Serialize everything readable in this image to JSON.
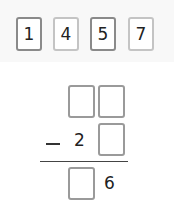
{
  "digit_cards": [
    {
      "value": "1",
      "style": "dark"
    },
    {
      "value": "4",
      "style": "light"
    },
    {
      "value": "5",
      "style": "dark"
    },
    {
      "value": "7",
      "style": "light"
    }
  ],
  "problem": {
    "operator": "−",
    "minuend": [
      "",
      ""
    ],
    "subtrahend": [
      "2",
      ""
    ],
    "difference": [
      "",
      "6"
    ]
  },
  "colors": {
    "card_border": "#8a8a8a",
    "card_border_light": "#c4c4c4",
    "panel_bg": "#f8f8f8"
  }
}
